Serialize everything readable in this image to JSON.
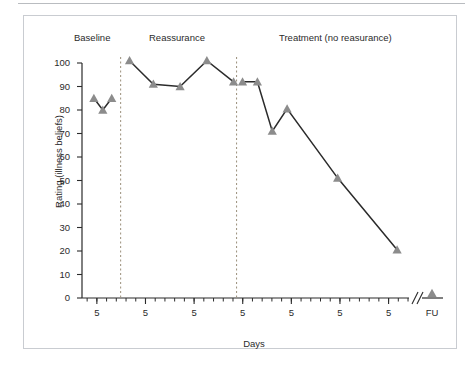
{
  "figure": {
    "ylabel": "Rating (illness beliefs)",
    "xlabel": "Days",
    "phases": [
      {
        "name": "baseline",
        "label": "Baseline"
      },
      {
        "name": "reassurance",
        "label": "Reassurance"
      },
      {
        "name": "treatment",
        "label": "Treatment (no reasurance)"
      }
    ],
    "followup_label": "FU",
    "marker_color": "#8c8c8c",
    "line_color": "#2b2b2b",
    "divider_color": "#9a8f7a",
    "frame_color": "#c9ccd1"
  },
  "chart_data": {
    "type": "line",
    "title": "",
    "xlabel": "Days",
    "ylabel": "Rating (illness beliefs)",
    "ylim": [
      0,
      100
    ],
    "yticks": [
      0,
      10,
      20,
      30,
      40,
      50,
      60,
      70,
      80,
      90,
      100
    ],
    "ytick_labels": [
      "0",
      "10",
      "20",
      "30",
      "40",
      "50",
      "60",
      "70",
      "80",
      "90",
      "100"
    ],
    "xtick_labels": [
      "5",
      "5",
      "5",
      "5",
      "5",
      "5",
      "5"
    ],
    "x_axis_break": true,
    "x_break_symbol": "//",
    "grid": false,
    "legend": false,
    "phase_labels": [
      "Baseline",
      "Reassurance",
      "Treatment (no reasurance)"
    ],
    "phase_dividers_x": [
      6.5,
      26.0
    ],
    "series": [
      {
        "name": "Illness beliefs rating",
        "phase_segments": [
          {
            "phase": "Baseline",
            "x": [
              2,
              3.5,
              5
            ],
            "values": [
              85,
              80,
              85
            ]
          },
          {
            "phase": "Reassurance",
            "x": [
              8,
              12,
              16.5,
              21,
              25.5
            ],
            "values": [
              101,
              91,
              90,
              101,
              92
            ]
          },
          {
            "phase": "Treatment (no reasurance)",
            "x": [
              27,
              29.5,
              32,
              34.5,
              43,
              53
            ],
            "values": [
              92,
              92,
              71,
              80.5,
              51,
              20.5
            ]
          },
          {
            "phase": "Follow-up",
            "x": [
              57
            ],
            "values": [
              2
            ]
          }
        ]
      }
    ]
  }
}
